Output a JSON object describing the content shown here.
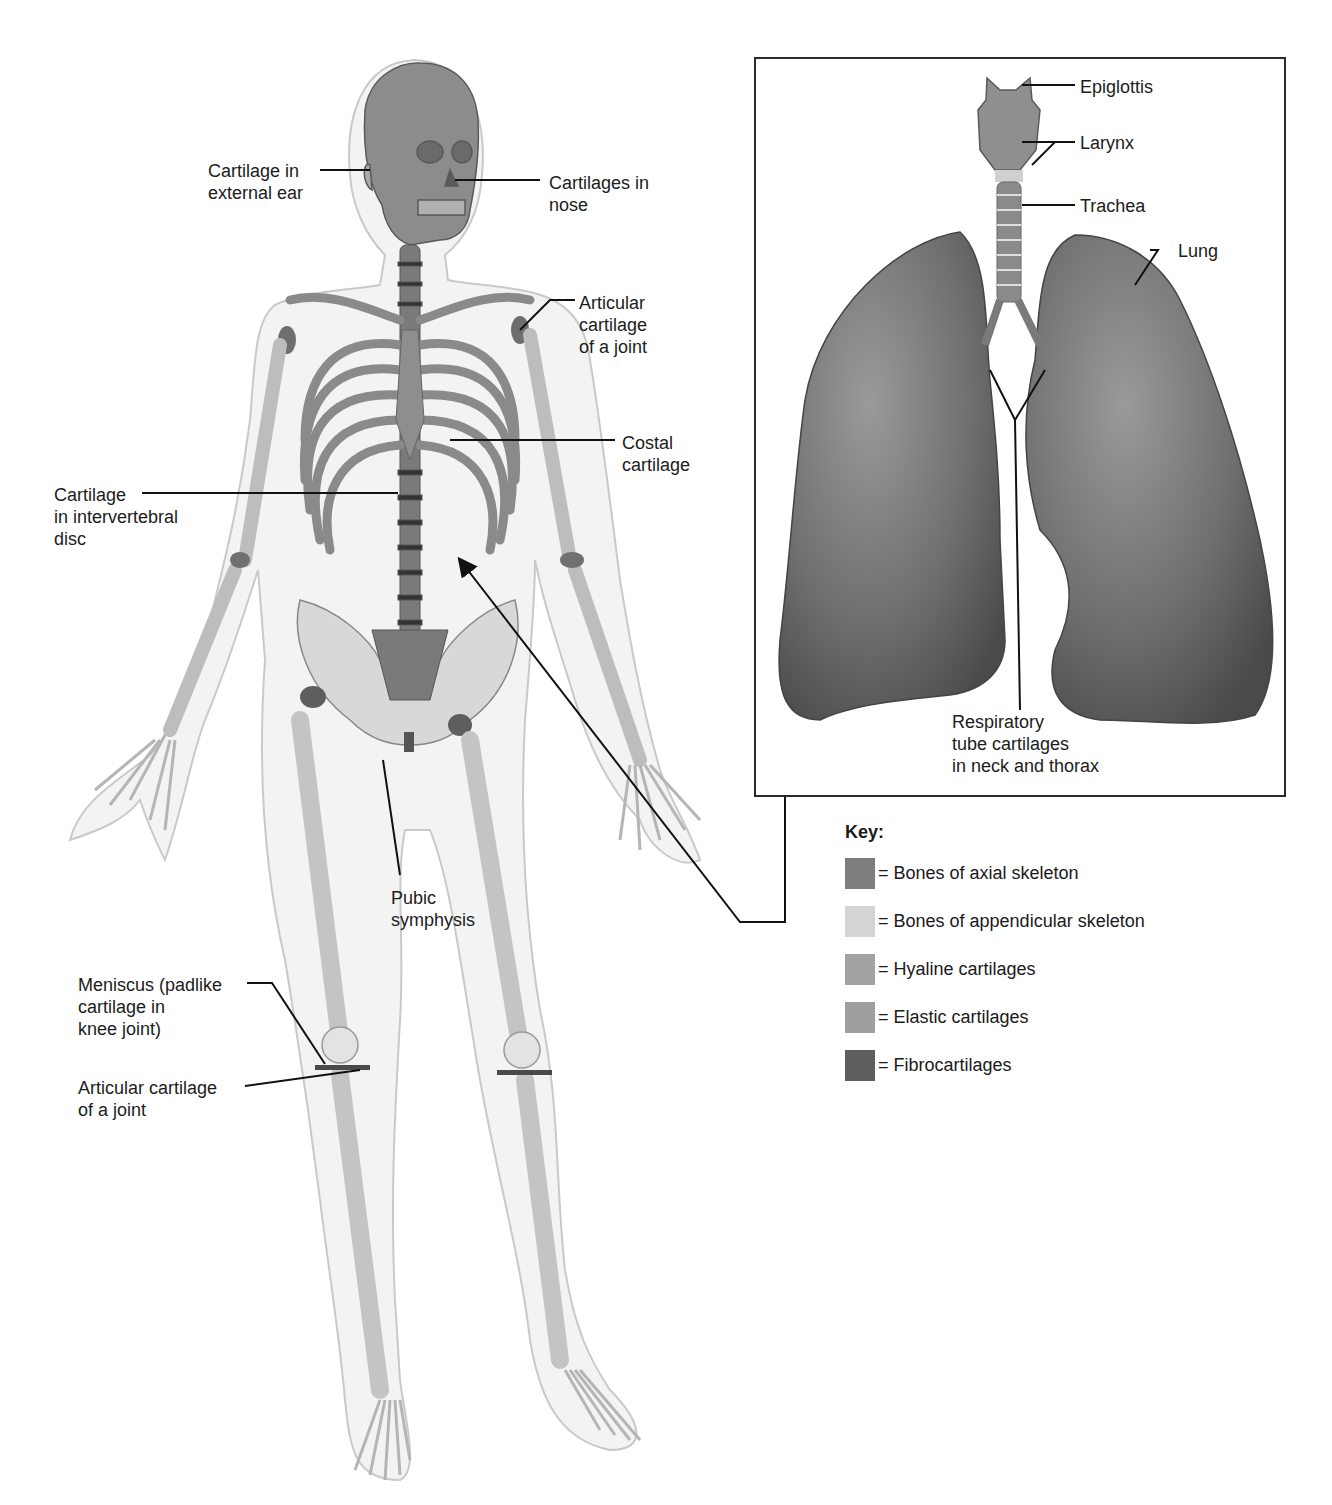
{
  "figure": {
    "skeleton_labels": {
      "ear": "Cartilage in\nexternal ear",
      "nose": "Cartilages in\nnose",
      "shoulder": "Articular\ncartilage\nof a joint",
      "costal": "Costal\ncartilage",
      "disc": "Cartilage\nin intervertebral\ndisc",
      "pubic": "Pubic\nsymphysis",
      "meniscus": "Meniscus (padlike\ncartilage in\nknee joint)",
      "knee_articular": "Articular cartilage\nof a joint"
    },
    "inset_labels": {
      "epiglottis": "Epiglottis",
      "larynx": "Larynx",
      "trachea": "Trachea",
      "lung": "Lung",
      "respiratory": "Respiratory\ntube cartilages\nin neck and thorax"
    },
    "key": {
      "title": "Key:",
      "items": [
        {
          "label": "= Bones of axial skeleton",
          "color": "#7d7d7d"
        },
        {
          "label": "= Bones of appendicular skeleton",
          "color": "#d4d4d4"
        },
        {
          "label": "= Hyaline cartilages",
          "color": "#a3a3a3"
        },
        {
          "label": "= Elastic cartilages",
          "color": "#9e9e9e"
        },
        {
          "label": "= Fibrocartilages",
          "color": "#5e5e5e"
        }
      ]
    }
  }
}
